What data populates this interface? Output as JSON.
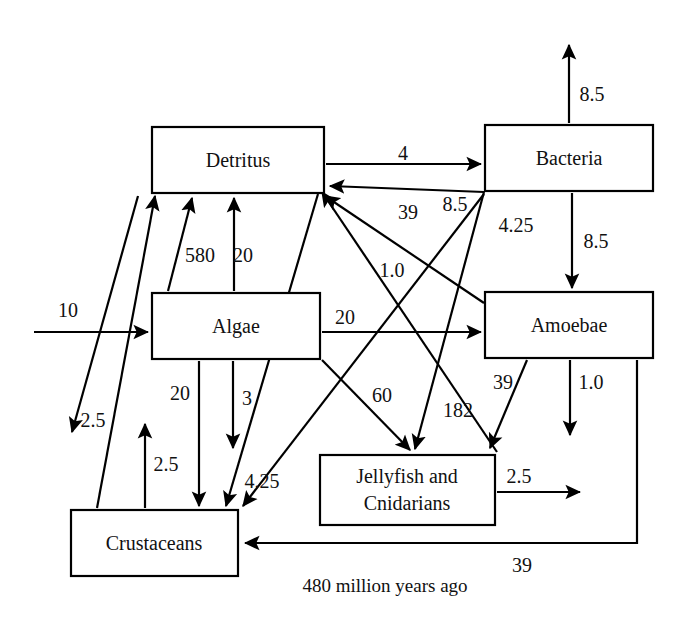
{
  "diagram": {
    "title": "480 million years ago",
    "caption": "480 million years ago",
    "type": "food-web-flow-diagram",
    "line_color": "#000000",
    "background_color": "#ffffff",
    "nodes": [
      {
        "id": "detritus",
        "label": "Detritus",
        "x": 152,
        "y": 127,
        "w": 172,
        "h": 66
      },
      {
        "id": "bacteria",
        "label": "Bacteria",
        "x": 485,
        "y": 125,
        "w": 168,
        "h": 66
      },
      {
        "id": "algae",
        "label": "Algae",
        "x": 152,
        "y": 293,
        "w": 168,
        "h": 66
      },
      {
        "id": "amoebae",
        "label": "Amoebae",
        "x": 485,
        "y": 292,
        "w": 168,
        "h": 66
      },
      {
        "id": "jellyfish",
        "label_line1": "Jellyfish and",
        "label_line2": "Cnidarians",
        "x": 320,
        "y": 455,
        "w": 175,
        "h": 70
      },
      {
        "id": "crustaceans",
        "label": "Crustaceans",
        "x": 71,
        "y": 510,
        "w": 167,
        "h": 66
      }
    ],
    "flows": [
      {
        "id": "input-to-algae",
        "from": "external",
        "to": "algae",
        "value": "10",
        "label_x": 68,
        "label_y": 312
      },
      {
        "id": "detritus-to-bacteria",
        "from": "detritus",
        "to": "bacteria",
        "value": "4",
        "label_x": 403,
        "label_y": 155
      },
      {
        "id": "bacteria-to-output",
        "from": "bacteria",
        "to": "external",
        "value": "8.5",
        "label_x": 592,
        "label_y": 96
      },
      {
        "id": "bacteria-to-amoebae",
        "from": "bacteria",
        "to": "amoebae",
        "value": "8.5",
        "label_x": 596,
        "label_y": 243
      },
      {
        "id": "bacteria-to-detritus",
        "from": "bacteria",
        "to": "detritus",
        "value": "39",
        "label_x": 408,
        "label_y": 214
      },
      {
        "id": "bacteria-to-jellyfish",
        "from": "bacteria",
        "to": "jellyfish",
        "value": "8.5",
        "label_x": 455,
        "label_y": 206
      },
      {
        "id": "bacteria-to-crustaceans",
        "from": "bacteria",
        "to": "crustaceans",
        "value": "4.25",
        "label_x": 516,
        "label_y": 227
      },
      {
        "id": "amoebae-to-detritus",
        "from": "amoebae",
        "to": "detritus",
        "value": "1.0",
        "label_x": 392,
        "label_y": 272
      },
      {
        "id": "algae-to-detritus-580",
        "from": "algae",
        "to": "detritus",
        "value": "580",
        "label_x": 200,
        "label_y": 257
      },
      {
        "id": "algae-to-detritus-20",
        "from": "algae",
        "to": "detritus",
        "value": "20",
        "label_x": 243,
        "label_y": 257
      },
      {
        "id": "algae-to-amoebae",
        "from": "algae",
        "to": "amoebae",
        "value": "20",
        "label_x": 345,
        "label_y": 319
      },
      {
        "id": "algae-to-crustaceans-20",
        "from": "algae",
        "to": "crustaceans",
        "value": "20",
        "label_x": 180,
        "label_y": 395
      },
      {
        "id": "algae-to-crustaceans-3",
        "from": "algae",
        "to": "crustaceans",
        "value": "3",
        "label_x": 247,
        "label_y": 400
      },
      {
        "id": "algae-to-jellyfish",
        "from": "algae",
        "to": "jellyfish",
        "value": "60",
        "label_x": 382,
        "label_y": 397
      },
      {
        "id": "crustaceans-to-detritus",
        "from": "crustaceans",
        "to": "detritus",
        "value": "2.5",
        "label_x": 93,
        "label_y": 422
      },
      {
        "id": "crustaceans-to-jellyfish",
        "from": "crustaceans",
        "to": "detritus2",
        "value": "2.5",
        "label_x": 166,
        "label_y": 466
      },
      {
        "id": "crustaceans-to-detritus-4",
        "from": "crustaceans",
        "to": "detritus",
        "value": "4.25",
        "label_x": 262,
        "label_y": 483
      },
      {
        "id": "jellyfish-to-detritus",
        "from": "jellyfish",
        "to": "detritus",
        "value": "182",
        "label_x": 458,
        "label_y": 412
      },
      {
        "id": "amoebae-to-jellyfish",
        "from": "amoebae",
        "to": "jellyfish",
        "value": "39",
        "label_x": 503,
        "label_y": 384
      },
      {
        "id": "amoebae-to-output",
        "from": "amoebae",
        "to": "external",
        "value": "1.0",
        "label_x": 591,
        "label_y": 384
      },
      {
        "id": "jellyfish-to-output",
        "from": "jellyfish",
        "to": "external",
        "value": "2.5",
        "label_x": 519,
        "label_y": 478
      },
      {
        "id": "amoebae-to-crustaceans",
        "from": "amoebae",
        "to": "crustaceans",
        "value": "39",
        "label_x": 522,
        "label_y": 567
      }
    ]
  }
}
